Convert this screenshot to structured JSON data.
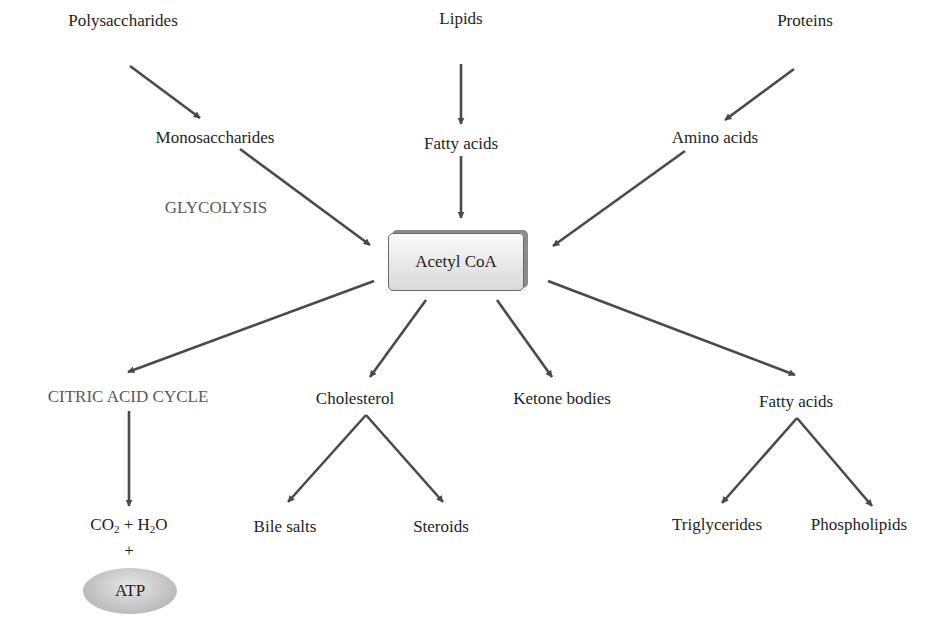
{
  "diagram": {
    "sources": {
      "polysaccharides": "Polysaccharides",
      "lipids": "Lipids",
      "proteins": "Proteins"
    },
    "intermediates": {
      "monosaccharides": "Monosaccharides",
      "fatty_acids_top": "Fatty acids",
      "amino_acids": "Amino acids",
      "glycolysis": "GLYCOLYSIS"
    },
    "center": {
      "acetyl_coa": "Acetyl CoA"
    },
    "products": {
      "citric_acid_cycle": "CITRIC ACID CYCLE",
      "cholesterol": "Cholesterol",
      "ketone_bodies": "Ketone bodies",
      "fatty_acids_bottom": "Fatty acids"
    },
    "end_products": {
      "co2": "CO",
      "co2_sub": "2",
      "plus_h2o": " + H",
      "h2o_sub": "2",
      "h2o_o": "O",
      "plus": "+",
      "atp": "ATP",
      "bile_salts": "Bile salts",
      "steroids": "Steroids",
      "triglycerides": "Triglycerides",
      "phospholipids": "Phospholipids"
    },
    "colors": {
      "arrow": "#4a4a4a",
      "process_label": "#5a5a5a",
      "box_border": "#6a6a6a"
    }
  }
}
